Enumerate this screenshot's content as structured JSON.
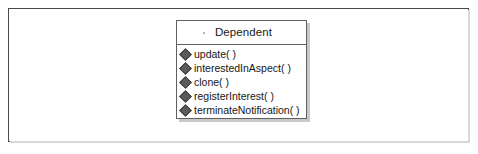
{
  "diagram": {
    "type": "uml-class-diagram",
    "frame": {
      "border_color": "#4a4a4a",
      "background": "#ffffff"
    },
    "class_box": {
      "name": "Dependent",
      "border_color": "#606060",
      "shadow_color": "#c9c9c9",
      "operation_marker_icon": "diamond-icon",
      "operation_marker_color": "#5b5b5b",
      "operations": [
        {
          "label": "update( )"
        },
        {
          "label": "interestedInAspect( )"
        },
        {
          "label": "clone( )"
        },
        {
          "label": "registerInterest( )"
        },
        {
          "label": "terminateNotification( )"
        }
      ]
    }
  }
}
